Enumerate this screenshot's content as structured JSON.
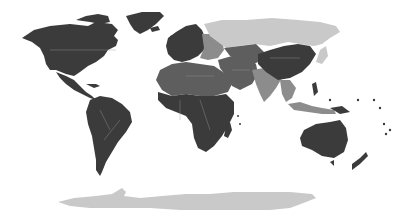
{
  "map": {
    "type": "choropleth-world",
    "palette": {
      "darkest": "#3b3b3b",
      "dark": "#5e5e5e",
      "medium": "#8c8c8c",
      "light": "#c9c9c9",
      "background": "#ffffff"
    },
    "regions": [
      {
        "name": "north-america",
        "shade": "darkest"
      },
      {
        "name": "greenland",
        "shade": "darkest"
      },
      {
        "name": "central-america",
        "shade": "darkest"
      },
      {
        "name": "south-america",
        "shade": "darkest"
      },
      {
        "name": "western-europe",
        "shade": "darkest"
      },
      {
        "name": "eastern-europe",
        "shade": "medium"
      },
      {
        "name": "russia",
        "shade": "light"
      },
      {
        "name": "north-africa",
        "shade": "dark"
      },
      {
        "name": "sub-saharan-africa",
        "shade": "darkest"
      },
      {
        "name": "middle-east",
        "shade": "dark"
      },
      {
        "name": "central-asia",
        "shade": "dark"
      },
      {
        "name": "china",
        "shade": "darkest"
      },
      {
        "name": "india",
        "shade": "medium"
      },
      {
        "name": "southeast-asia",
        "shade": "medium"
      },
      {
        "name": "japan",
        "shade": "light"
      },
      {
        "name": "australia",
        "shade": "darkest"
      },
      {
        "name": "new-zealand",
        "shade": "darkest"
      },
      {
        "name": "antarctica",
        "shade": "light"
      }
    ]
  }
}
